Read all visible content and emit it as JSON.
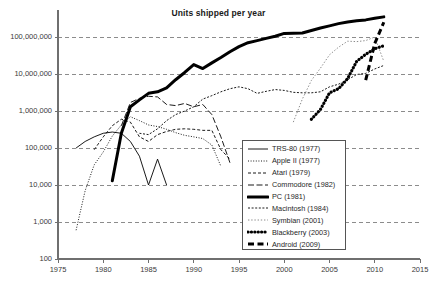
{
  "chart_data": {
    "type": "line",
    "title": "Units shipped per year",
    "xlabel": "",
    "ylabel": "",
    "yscale": "log",
    "ylim": [
      100,
      500000000
    ],
    "xlim": [
      1975,
      2015
    ],
    "grid": true,
    "legend_position": "center-right-inside",
    "y_ticks": [
      "100",
      "1,000",
      "10,000",
      "100,000",
      "1,000,000",
      "10,000,000",
      "100,000,000"
    ],
    "y_tick_values": [
      100,
      1000,
      10000,
      100000,
      1000000,
      10000000,
      100000000
    ],
    "x_ticks": [
      "1975",
      "1980",
      "1985",
      "1990",
      "1995",
      "2000",
      "2005",
      "2010",
      "2015"
    ],
    "x_tick_values": [
      1975,
      1980,
      1985,
      1990,
      1995,
      2000,
      2005,
      2010,
      2015
    ],
    "series": [
      {
        "name": "TRS-80 (1977)",
        "style": "thin-solid",
        "color": "#000000",
        "x": [
          1977,
          1978,
          1979,
          1980,
          1981,
          1982,
          1983,
          1984,
          1985,
          1986,
          1987
        ],
        "values": [
          100000,
          150000,
          200000,
          250000,
          270000,
          250000,
          150000,
          60000,
          10000,
          50000,
          10000
        ]
      },
      {
        "name": "Apple II (1977)",
        "style": "fine-dotted",
        "color": "#000000",
        "x": [
          1977,
          1978,
          1979,
          1980,
          1981,
          1982,
          1983,
          1984,
          1985,
          1986,
          1987,
          1988,
          1989,
          1990,
          1991,
          1992,
          1993
        ],
        "values": [
          600,
          7000,
          35000,
          78000,
          210000,
          420000,
          700000,
          550000,
          420000,
          380000,
          320000,
          260000,
          220000,
          200000,
          180000,
          120000,
          32000
        ]
      },
      {
        "name": "Atari (1979)",
        "style": "short-dash",
        "color": "#000000",
        "x": [
          1979,
          1980,
          1981,
          1982,
          1983,
          1984,
          1985,
          1986,
          1987,
          1988,
          1989,
          1990,
          1991,
          1992,
          1993,
          1994
        ],
        "values": [
          90000,
          200000,
          400000,
          600000,
          500000,
          200000,
          150000,
          230000,
          280000,
          320000,
          330000,
          320000,
          300000,
          300000,
          90000,
          50000
        ]
      },
      {
        "name": "Commodore (1982)",
        "style": "long-dash",
        "color": "#000000",
        "x": [
          1982,
          1983,
          1984,
          1985,
          1986,
          1987,
          1988,
          1989,
          1990,
          1991,
          1992,
          1993,
          1994
        ],
        "values": [
          400000,
          1700000,
          2200000,
          2500000,
          2400000,
          1500000,
          1400000,
          1600000,
          1300000,
          1500000,
          800000,
          200000,
          40000
        ]
      },
      {
        "name": "PC (1981)",
        "style": "thick-solid",
        "color": "#000000",
        "x": [
          1981,
          1982,
          1983,
          1984,
          1985,
          1986,
          1987,
          1988,
          1989,
          1990,
          1991,
          1992,
          1993,
          1994,
          1995,
          1996,
          1997,
          1998,
          1999,
          2000,
          2001,
          2002,
          2003,
          2004,
          2005,
          2006,
          2007,
          2008,
          2009,
          2010,
          2011
        ],
        "values": [
          13000,
          250000,
          1300000,
          2000000,
          3000000,
          3300000,
          4200000,
          7000000,
          11000000,
          18000000,
          14000000,
          20000000,
          28000000,
          40000000,
          55000000,
          70000000,
          80000000,
          92000000,
          105000000,
          125000000,
          127000000,
          128000000,
          150000000,
          175000000,
          200000000,
          230000000,
          255000000,
          275000000,
          290000000,
          320000000,
          350000000
        ]
      },
      {
        "name": "Macintosh (1984)",
        "style": "medium-dotted",
        "color": "#000000",
        "x": [
          1984,
          1985,
          1986,
          1987,
          1988,
          1989,
          1990,
          1991,
          1992,
          1993,
          1994,
          1995,
          1996,
          1997,
          1998,
          1999,
          2000,
          2001,
          2002,
          2003,
          2004,
          2005,
          2006,
          2007,
          2008,
          2009,
          2010,
          2011
        ],
        "values": [
          250000,
          230000,
          330000,
          550000,
          800000,
          1000000,
          1300000,
          2100000,
          2600000,
          3300000,
          4000000,
          4500000,
          4000000,
          3000000,
          3400000,
          3800000,
          3600000,
          3200000,
          3100000,
          3100000,
          3300000,
          4500000,
          5300000,
          7000000,
          9700000,
          10400000,
          13700000,
          17000000
        ]
      },
      {
        "name": "Symbian (2001)",
        "style": "light-dotted",
        "color": "#8c8c8c",
        "x": [
          2001,
          2002,
          2003,
          2004,
          2005,
          2006,
          2007,
          2008,
          2009,
          2010,
          2011
        ],
        "values": [
          500000,
          2100000,
          6700000,
          14400000,
          33000000,
          53000000,
          77000000,
          75000000,
          80000000,
          100000000,
          22000000
        ]
      },
      {
        "name": "Blackberry (2003)",
        "style": "thick-dotted",
        "color": "#000000",
        "x": [
          2003,
          2004,
          2005,
          2006,
          2007,
          2008,
          2009,
          2010,
          2011
        ],
        "values": [
          600000,
          1100000,
          3100000,
          4000000,
          7500000,
          22000000,
          34000000,
          48000000,
          58000000
        ]
      },
      {
        "name": "Android (2009)",
        "style": "thick-dash",
        "color": "#000000",
        "x": [
          2009,
          2010,
          2011
        ],
        "values": [
          6800000,
          67000000,
          250000000
        ]
      }
    ]
  },
  "legend": {
    "entries": [
      {
        "label": "TRS-80 (1977)"
      },
      {
        "label": "Apple II (1977)"
      },
      {
        "label": "Atari (1979)"
      },
      {
        "label": "Commodore (1982)"
      },
      {
        "label": "PC (1981)"
      },
      {
        "label": "Macintosh (1984)"
      },
      {
        "label": "Symbian (2001)"
      },
      {
        "label": "Blackberry (2003)"
      },
      {
        "label": "Android (2009)"
      }
    ]
  },
  "colors": {
    "background": "#ffffff",
    "axis": "#6f6f6f",
    "grid": "#6f6f6f",
    "text": "#231f20",
    "line": "#000000",
    "symbian": "#8c8c8c"
  }
}
